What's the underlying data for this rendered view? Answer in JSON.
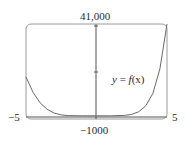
{
  "chart_data": {
    "type": "line",
    "title": "",
    "xlabel": "",
    "ylabel": "",
    "xlim": [
      -5,
      5
    ],
    "ylim": [
      -1000,
      41000
    ],
    "grid": false,
    "legend": null,
    "tick_labels": {
      "x_left": "−5",
      "x_right": "5",
      "y_top": "41,000",
      "y_bottom": "−1000"
    },
    "annotations": [
      {
        "text": "y = f(x)",
        "x": 3.3,
        "y": 18000
      }
    ],
    "series": [
      {
        "name": "y = f(x)",
        "x": [
          -5,
          -4.5,
          -4,
          -3.5,
          -3,
          -2.5,
          -2,
          -1,
          0,
          1,
          2,
          2.5,
          3,
          3.5,
          4,
          4.5,
          5
        ],
        "y": [
          17300,
          10500,
          5800,
          2900,
          1200,
          400,
          80,
          0,
          0,
          0,
          150,
          600,
          1800,
          4500,
          10000,
          21000,
          41000
        ]
      }
    ]
  },
  "labels": {
    "y_top": "41,000",
    "y_bottom": "−1000",
    "x_left": "−5",
    "x_right": "5",
    "curve_y": "y",
    "curve_eq": " = ",
    "curve_f": "f",
    "curve_arg": "(x)"
  },
  "colors": {
    "frame": "#9a9a9a",
    "axis": "#555555",
    "curve": "#6a6a6a",
    "text": "#2a2a2a"
  }
}
